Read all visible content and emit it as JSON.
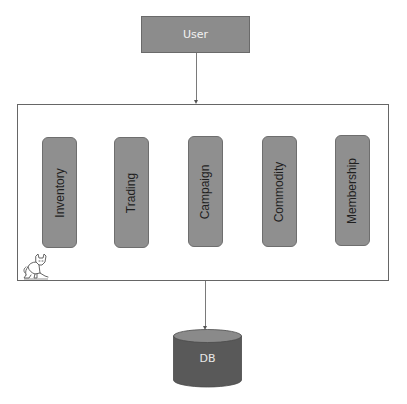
{
  "diagram": {
    "user": {
      "label": "User"
    },
    "container": {
      "icon": "tomcat-icon",
      "services": [
        {
          "label": "Inventory"
        },
        {
          "label": "Trading"
        },
        {
          "label": "Campaign"
        },
        {
          "label": "Commodity"
        },
        {
          "label": "Membership"
        }
      ]
    },
    "database": {
      "label": "DB"
    },
    "edges": [
      {
        "from": "User",
        "to": "container"
      },
      {
        "from": "container",
        "to": "DB"
      }
    ],
    "colors": {
      "node_fill": "#8c8c8c",
      "db_fill": "#595959",
      "db_top": "#8a8a8a",
      "border": "#666666"
    }
  }
}
